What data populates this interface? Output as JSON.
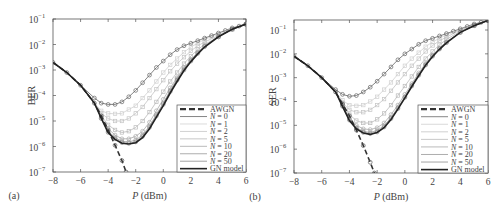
{
  "chart_data": [
    {
      "type": "line",
      "panel_label": "(a)",
      "xlabel": "P (dBm)",
      "ylabel": "BER",
      "xlim": [
        -8,
        6
      ],
      "ylim_log10": [
        -7,
        -1
      ],
      "yscale": "log",
      "x_ticks": [
        "-8",
        "-6",
        "-4",
        "-2",
        "0",
        "2",
        "4",
        "6"
      ],
      "y_ticks": [
        "10^-7",
        "10^-6",
        "10^-5",
        "10^-4",
        "10^-3",
        "10^-2",
        "10^-1"
      ],
      "legend": [
        "AWGN",
        "N = 0",
        "N = 1",
        "N = 2",
        "N = 5",
        "N = 10",
        "N = 20",
        "N = 50",
        "GN model"
      ],
      "legend_position": "lower right",
      "grid": false,
      "series": [
        {
          "name": "AWGN",
          "style": "dashed",
          "x": [
            -8,
            -7,
            -6,
            -5,
            -4.5,
            -4,
            -3.5,
            -3,
            -2.7
          ],
          "log10y": [
            -2.7,
            -3.1,
            -3.6,
            -4.3,
            -4.8,
            -5.35,
            -5.95,
            -6.55,
            -7.0
          ]
        },
        {
          "name": "N = 0",
          "style": "solid-circle",
          "x": [
            -8,
            -7,
            -6,
            -5,
            -4.5,
            -4,
            -3.5,
            -3,
            -2.5,
            -2,
            -1.5,
            -1,
            -0.5,
            0,
            0.5,
            1,
            1.5,
            2,
            2.5,
            3,
            3.5,
            4,
            4.5,
            5,
            5.5,
            6
          ],
          "log10y": [
            -2.7,
            -3.1,
            -3.6,
            -4.1,
            -4.3,
            -4.35,
            -4.35,
            -4.25,
            -4.05,
            -3.8,
            -3.5,
            -3.2,
            -2.9,
            -2.65,
            -2.4,
            -2.2,
            -2.05,
            -1.95,
            -1.85,
            -1.75,
            -1.65,
            -1.55,
            -1.45,
            -1.35,
            -1.28,
            -1.2
          ]
        },
        {
          "name": "N = 1",
          "style": "solid-square",
          "x": [
            -8,
            -7,
            -6,
            -5,
            -4.5,
            -4,
            -3.5,
            -3,
            -2.5,
            -2,
            -1.5,
            -1,
            -0.5,
            0,
            0.5,
            1,
            1.5,
            2,
            2.5,
            3,
            3.5,
            4,
            5,
            6
          ],
          "log10y": [
            -2.7,
            -3.1,
            -3.6,
            -4.3,
            -4.6,
            -4.7,
            -4.72,
            -4.7,
            -4.55,
            -4.4,
            -4.1,
            -3.8,
            -3.45,
            -3.1,
            -2.8,
            -2.55,
            -2.3,
            -2.1,
            -1.95,
            -1.8,
            -1.7,
            -1.6,
            -1.4,
            -1.2
          ]
        },
        {
          "name": "N = 2",
          "style": "solid-square",
          "x": [
            -8,
            -7,
            -6,
            -5,
            -4.5,
            -4,
            -3.5,
            -3,
            -2.5,
            -2,
            -1.5,
            -1,
            -0.5,
            0,
            0.5,
            1,
            1.5,
            2,
            2.5,
            3,
            4,
            5,
            6
          ],
          "log10y": [
            -2.7,
            -3.1,
            -3.6,
            -4.3,
            -4.7,
            -4.9,
            -5.0,
            -5.0,
            -4.9,
            -4.7,
            -4.45,
            -4.1,
            -3.75,
            -3.4,
            -3.05,
            -2.75,
            -2.5,
            -2.25,
            -2.05,
            -1.9,
            -1.65,
            -1.4,
            -1.2
          ]
        },
        {
          "name": "N = 5",
          "style": "solid-square",
          "x": [
            -8,
            -7,
            -6,
            -5,
            -4.5,
            -4,
            -3.5,
            -3,
            -2.5,
            -2,
            -1.5,
            -1,
            -0.5,
            0,
            0.5,
            1,
            1.5,
            2,
            2.5,
            3,
            4,
            5,
            6
          ],
          "log10y": [
            -2.7,
            -3.1,
            -3.6,
            -4.3,
            -4.8,
            -5.15,
            -5.35,
            -5.45,
            -5.4,
            -5.25,
            -5.0,
            -4.65,
            -4.25,
            -3.85,
            -3.45,
            -3.1,
            -2.75,
            -2.45,
            -2.2,
            -2.0,
            -1.7,
            -1.4,
            -1.2
          ]
        },
        {
          "name": "N = 10",
          "style": "solid-circle",
          "x": [
            -8,
            -7,
            -6,
            -5,
            -4.5,
            -4,
            -3.5,
            -3,
            -2.5,
            -2,
            -1.5,
            -1,
            -0.5,
            0,
            0.5,
            1,
            1.5,
            2,
            2.5,
            3,
            4,
            5,
            6
          ],
          "log10y": [
            -2.7,
            -3.1,
            -3.6,
            -4.3,
            -4.85,
            -5.3,
            -5.55,
            -5.7,
            -5.7,
            -5.6,
            -5.4,
            -5.05,
            -4.6,
            -4.15,
            -3.7,
            -3.3,
            -2.9,
            -2.6,
            -2.3,
            -2.05,
            -1.7,
            -1.4,
            -1.2
          ]
        },
        {
          "name": "N = 20",
          "style": "solid-circle",
          "x": [
            -8,
            -7,
            -6,
            -5,
            -4.5,
            -4,
            -3.5,
            -3,
            -2.5,
            -2,
            -1.5,
            -1,
            -0.5,
            0,
            0.5,
            1,
            1.5,
            2,
            2.5,
            3,
            4,
            5,
            6
          ],
          "log10y": [
            -2.7,
            -3.1,
            -3.6,
            -4.3,
            -4.9,
            -5.4,
            -5.65,
            -5.8,
            -5.82,
            -5.75,
            -5.55,
            -5.2,
            -4.75,
            -4.3,
            -3.8,
            -3.35,
            -2.95,
            -2.62,
            -2.32,
            -2.07,
            -1.7,
            -1.4,
            -1.2
          ]
        },
        {
          "name": "N = 50",
          "style": "solid-circle",
          "x": [
            -8,
            -7,
            -6,
            -5,
            -4.5,
            -4,
            -3.5,
            -3,
            -2.5,
            -2,
            -1.5,
            -1,
            -0.5,
            0,
            0.5,
            1,
            1.5,
            2,
            2.5,
            3,
            4,
            5,
            6
          ],
          "log10y": [
            -2.7,
            -3.1,
            -3.6,
            -4.3,
            -4.9,
            -5.45,
            -5.7,
            -5.85,
            -5.88,
            -5.82,
            -5.6,
            -5.25,
            -4.8,
            -4.35,
            -3.85,
            -3.4,
            -3.0,
            -2.65,
            -2.35,
            -2.08,
            -1.7,
            -1.4,
            -1.2
          ]
        },
        {
          "name": "GN model",
          "style": "solid-thick",
          "x": [
            -8,
            -7,
            -6,
            -5,
            -4.5,
            -4,
            -3.5,
            -3,
            -2.5,
            -2,
            -1.5,
            -1,
            -0.5,
            0,
            0.5,
            1,
            1.5,
            2,
            2.5,
            3,
            4,
            5,
            6
          ],
          "log10y": [
            -2.7,
            -3.1,
            -3.6,
            -4.3,
            -4.9,
            -5.45,
            -5.72,
            -5.87,
            -5.9,
            -5.85,
            -5.65,
            -5.3,
            -4.85,
            -4.4,
            -3.9,
            -3.45,
            -3.02,
            -2.67,
            -2.37,
            -2.1,
            -1.7,
            -1.4,
            -1.2
          ]
        }
      ]
    },
    {
      "type": "line",
      "panel_label": "(b)",
      "xlabel": "P (dBm)",
      "ylabel": "SER",
      "xlim": [
        -8,
        6
      ],
      "ylim_log10": [
        -7,
        -0.6
      ],
      "yscale": "log",
      "x_ticks": [
        "-8",
        "-6",
        "-4",
        "-2",
        "0",
        "2",
        "4",
        "6"
      ],
      "y_ticks": [
        "10^-7",
        "10^-6",
        "10^-5",
        "10^-4",
        "10^-3",
        "10^-2",
        "10^-1"
      ],
      "legend": [
        "AWGN",
        "N = 0",
        "N = 1",
        "N = 2",
        "N = 5",
        "N = 10",
        "N = 20",
        "N = 50",
        "GN model"
      ],
      "legend_position": "lower right",
      "grid": false,
      "series": [
        {
          "name": "AWGN",
          "style": "dashed",
          "x": [
            -8,
            -7,
            -6,
            -5,
            -4.5,
            -4,
            -3.5,
            -3,
            -2.5,
            -2.2
          ],
          "log10y": [
            -2.1,
            -2.5,
            -3.0,
            -3.6,
            -4.1,
            -4.6,
            -5.2,
            -5.85,
            -6.55,
            -7.0
          ]
        },
        {
          "name": "N = 0",
          "style": "solid-circle",
          "x": [
            -8,
            -7,
            -6,
            -5,
            -4.5,
            -4,
            -3.5,
            -3,
            -2.5,
            -2,
            -1.5,
            -1,
            -0.5,
            0,
            0.5,
            1,
            1.5,
            2,
            2.5,
            3,
            3.5,
            4,
            4.5,
            5,
            5.5,
            6
          ],
          "log10y": [
            -2.1,
            -2.5,
            -3.0,
            -3.5,
            -3.7,
            -3.78,
            -3.75,
            -3.6,
            -3.4,
            -3.15,
            -2.85,
            -2.55,
            -2.25,
            -2.0,
            -1.8,
            -1.6,
            -1.45,
            -1.35,
            -1.25,
            -1.15,
            -1.05,
            -0.95,
            -0.85,
            -0.75,
            -0.68,
            -0.6
          ]
        },
        {
          "name": "N = 1",
          "style": "solid-square",
          "x": [
            -8,
            -7,
            -6,
            -5,
            -4.5,
            -4,
            -3.5,
            -3,
            -2.5,
            -2,
            -1.5,
            -1,
            -0.5,
            0,
            0.5,
            1,
            1.5,
            2,
            2.5,
            3,
            4,
            5,
            6
          ],
          "log10y": [
            -2.1,
            -2.5,
            -3.0,
            -3.6,
            -3.95,
            -4.15,
            -4.18,
            -4.15,
            -4.0,
            -3.8,
            -3.5,
            -3.2,
            -2.85,
            -2.5,
            -2.2,
            -1.95,
            -1.7,
            -1.5,
            -1.35,
            -1.2,
            -1.0,
            -0.8,
            -0.6
          ]
        },
        {
          "name": "N = 2",
          "style": "solid-square",
          "x": [
            -8,
            -7,
            -6,
            -5,
            -4.5,
            -4,
            -3.5,
            -3,
            -2.5,
            -2,
            -1.5,
            -1,
            -0.5,
            0,
            0.5,
            1,
            1.5,
            2,
            2.5,
            3,
            4,
            5,
            6
          ],
          "log10y": [
            -2.1,
            -2.5,
            -3.0,
            -3.6,
            -4.05,
            -4.35,
            -4.45,
            -4.45,
            -4.35,
            -4.15,
            -3.9,
            -3.55,
            -3.2,
            -2.85,
            -2.5,
            -2.2,
            -1.9,
            -1.65,
            -1.45,
            -1.3,
            -1.0,
            -0.8,
            -0.6
          ]
        },
        {
          "name": "N = 5",
          "style": "solid-square",
          "x": [
            -8,
            -7,
            -6,
            -5,
            -4.5,
            -4,
            -3.5,
            -3,
            -2.5,
            -2,
            -1.5,
            -1,
            -0.5,
            0,
            0.5,
            1,
            1.5,
            2,
            2.5,
            3,
            4,
            5,
            6
          ],
          "log10y": [
            -2.1,
            -2.5,
            -3.0,
            -3.6,
            -4.1,
            -4.55,
            -4.8,
            -4.9,
            -4.9,
            -4.75,
            -4.5,
            -4.15,
            -3.75,
            -3.35,
            -2.95,
            -2.55,
            -2.2,
            -1.9,
            -1.62,
            -1.4,
            -1.05,
            -0.8,
            -0.6
          ]
        },
        {
          "name": "N = 10",
          "style": "solid-circle",
          "x": [
            -8,
            -7,
            -6,
            -5,
            -4.5,
            -4,
            -3.5,
            -3,
            -2.5,
            -2,
            -1.5,
            -1,
            -0.5,
            0,
            0.5,
            1,
            1.5,
            2,
            2.5,
            3,
            4,
            5,
            6
          ],
          "log10y": [
            -2.1,
            -2.5,
            -3.0,
            -3.6,
            -4.15,
            -4.7,
            -5.0,
            -5.15,
            -5.18,
            -5.1,
            -4.9,
            -4.55,
            -4.15,
            -3.7,
            -3.25,
            -2.8,
            -2.4,
            -2.05,
            -1.75,
            -1.5,
            -1.1,
            -0.82,
            -0.6
          ]
        },
        {
          "name": "N = 20",
          "style": "solid-circle",
          "x": [
            -8,
            -7,
            -6,
            -5,
            -4.5,
            -4,
            -3.5,
            -3,
            -2.5,
            -2,
            -1.5,
            -1,
            -0.5,
            0,
            0.5,
            1,
            1.5,
            2,
            2.5,
            3,
            4,
            5,
            6
          ],
          "log10y": [
            -2.1,
            -2.5,
            -3.0,
            -3.6,
            -4.18,
            -4.75,
            -5.1,
            -5.25,
            -5.3,
            -5.22,
            -5.02,
            -4.67,
            -4.25,
            -3.8,
            -3.32,
            -2.87,
            -2.45,
            -2.08,
            -1.78,
            -1.52,
            -1.1,
            -0.82,
            -0.6
          ]
        },
        {
          "name": "N = 50",
          "style": "solid-circle",
          "x": [
            -8,
            -7,
            -6,
            -5,
            -4.5,
            -4,
            -3.5,
            -3,
            -2.5,
            -2,
            -1.5,
            -1,
            -0.5,
            0,
            0.5,
            1,
            1.5,
            2,
            2.5,
            3,
            4,
            5,
            6
          ],
          "log10y": [
            -2.1,
            -2.5,
            -3.0,
            -3.6,
            -4.2,
            -4.78,
            -5.13,
            -5.3,
            -5.35,
            -5.28,
            -5.07,
            -4.72,
            -4.3,
            -3.83,
            -3.35,
            -2.9,
            -2.47,
            -2.1,
            -1.8,
            -1.53,
            -1.1,
            -0.82,
            -0.6
          ]
        },
        {
          "name": "GN model",
          "style": "solid-thick",
          "x": [
            -8,
            -7,
            -6,
            -5,
            -4.5,
            -4,
            -3.5,
            -3,
            -2.5,
            -2,
            -1.5,
            -1,
            -0.5,
            0,
            0.5,
            1,
            1.5,
            2,
            2.5,
            3,
            4,
            5,
            6
          ],
          "log10y": [
            -2.1,
            -2.5,
            -3.0,
            -3.6,
            -4.2,
            -4.8,
            -5.15,
            -5.32,
            -5.38,
            -5.3,
            -5.1,
            -4.75,
            -4.32,
            -3.85,
            -3.37,
            -2.92,
            -2.48,
            -2.11,
            -1.81,
            -1.54,
            -1.1,
            -0.82,
            -0.6
          ]
        }
      ]
    }
  ],
  "panels": [
    {
      "label": "(a)",
      "ylabel": "BER",
      "xlabel_italic": "P",
      "xlabel_unit": " (dBm)"
    },
    {
      "label": "(b)",
      "ylabel": "SER",
      "xlabel_italic": "P",
      "xlabel_unit": " (dBm)"
    }
  ],
  "legend_labels": [
    "AWGN",
    "N = 0",
    "N = 1",
    "N = 2",
    "N = 5",
    "N = 10",
    "N = 20",
    "N = 50",
    "GN model"
  ],
  "colors": {
    "axis": "#555555",
    "text": "#444444",
    "n0": "#777777",
    "n_light": "#c8c8c8",
    "n_mid": "#aaaaaa",
    "gn": "#222222",
    "awgn": "#333333"
  }
}
